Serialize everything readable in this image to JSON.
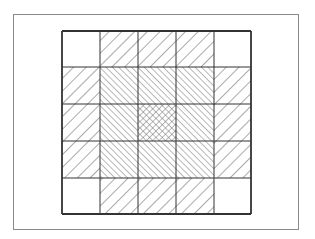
{
  "figure": {
    "frame": {
      "x": 13,
      "y": 14,
      "w": 286,
      "h": 216
    },
    "grid": {
      "x": 62,
      "y": 31,
      "col_edges": [
        62,
        100,
        138,
        176,
        214,
        251
      ],
      "row_edges": [
        31,
        67,
        104,
        141,
        178,
        214
      ],
      "rows": 5,
      "cols": 5,
      "line_color": "#333333"
    },
    "patterns": {
      "blank": "none",
      "sparse": "forward-diagonal-sparse",
      "dense": "backward-diagonal-dense",
      "cross": "crosshatch-dense"
    },
    "cells": [
      [
        "blank",
        "sparse",
        "sparse",
        "sparse",
        "blank"
      ],
      [
        "sparse",
        "dense",
        "dense",
        "dense",
        "sparse"
      ],
      [
        "sparse",
        "dense",
        "cross",
        "dense",
        "sparse"
      ],
      [
        "sparse",
        "dense",
        "dense",
        "dense",
        "sparse"
      ],
      [
        "blank",
        "sparse",
        "sparse",
        "sparse",
        "blank"
      ]
    ]
  }
}
